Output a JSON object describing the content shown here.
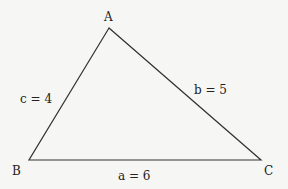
{
  "diagram": {
    "type": "triangle",
    "vertices": [
      {
        "name": "A",
        "x": 109,
        "y": 28
      },
      {
        "name": "B",
        "x": 29,
        "y": 160
      },
      {
        "name": "C",
        "x": 261,
        "y": 160
      }
    ],
    "sides": [
      {
        "label": "a = 6",
        "between": "B-C"
      },
      {
        "label": "b = 5",
        "between": "A-C"
      },
      {
        "label": "c = 4",
        "between": "A-B"
      }
    ],
    "stroke_color": "#333333",
    "background": "#f6f6f4"
  }
}
